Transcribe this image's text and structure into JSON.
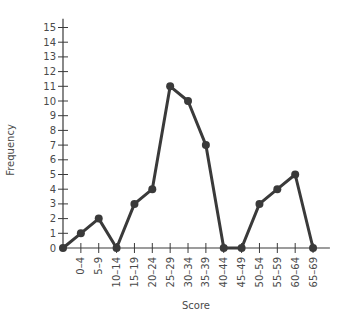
{
  "chart_data": {
    "type": "line",
    "title": "",
    "xlabel": "Score",
    "ylabel": "Frequency",
    "categories": [
      "0–4",
      "5–9",
      "10–14",
      "15–19",
      "20–24",
      "25–29",
      "30–34",
      "35–39",
      "40–44",
      "45–49",
      "50–54",
      "55–59",
      "60–64",
      "65–69"
    ],
    "values": [
      1,
      2,
      0,
      3,
      4,
      11,
      10,
      7,
      0,
      0,
      3,
      4,
      5,
      0
    ],
    "start_point": {
      "x": "origin",
      "y": 0
    },
    "ylim": [
      0,
      15
    ],
    "yticks": [
      "0",
      "1",
      "2",
      "3",
      "4",
      "5",
      "6",
      "7",
      "8",
      "9",
      "10",
      "11",
      "12",
      "13",
      "14",
      "15"
    ],
    "grid": false,
    "legend": null,
    "colors": {
      "line": "#3a3a3a",
      "axis": "#3a3a3a",
      "text": "#4a4a4a"
    }
  }
}
